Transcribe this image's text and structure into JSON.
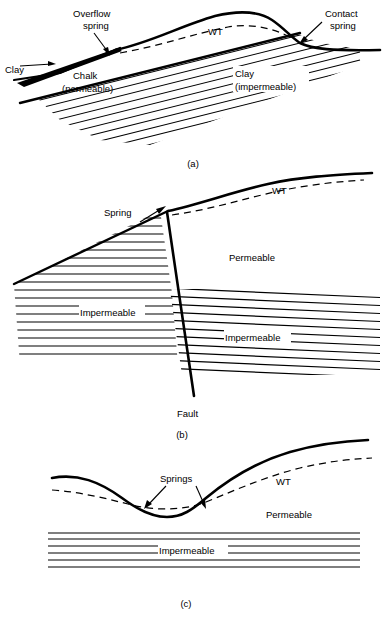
{
  "figure": {
    "panels": [
      {
        "id": "a",
        "caption": "(a)",
        "description": "Overflow spring and contact spring on dipping chalk beneath clay",
        "labels": {
          "overflow_spring": "Overflow\nspring",
          "overflow_spring_line1": "Overflow",
          "overflow_spring_line2": "spring",
          "contact_spring_line1": "Contact",
          "contact_spring_line2": "spring",
          "clay_left": "Clay",
          "chalk_line1": "Chalk",
          "chalk_line2": "(permeable)",
          "clay_right_line1": "Clay",
          "clay_right_line2": "(impermeable)",
          "water_table": "WT"
        }
      },
      {
        "id": "b",
        "caption": "(b)",
        "description": "Fault spring where a fault juxtaposes permeable and impermeable strata",
        "labels": {
          "spring": "Spring",
          "water_table": "WT",
          "permeable": "Permeable",
          "impermeable_left": "Impermeable",
          "impermeable_right": "Impermeable",
          "fault": "Fault"
        }
      },
      {
        "id": "c",
        "caption": "(c)",
        "description": "Valley springs where the water table intersects the ground surface",
        "labels": {
          "springs": "Springs",
          "water_table": "WT",
          "permeable": "Permeable",
          "impermeable": "Impermeable"
        }
      }
    ]
  },
  "colors": {
    "ink": "#000000",
    "background": "#ffffff"
  }
}
